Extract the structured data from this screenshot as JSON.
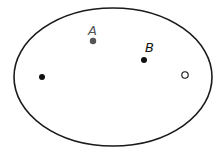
{
  "diagram": {
    "shape": "ellipse",
    "ellipse": {
      "cx": 113,
      "cy": 77,
      "rx": 99,
      "ry": 69,
      "stroke": "#1a1a1a"
    },
    "points": [
      {
        "id": "A",
        "label": "A",
        "x": 93,
        "y": 41,
        "fill": "#555555",
        "type": "filled",
        "label_x": 89,
        "label_y": 34,
        "label_color": "#555555"
      },
      {
        "id": "B",
        "label": "B",
        "x": 144,
        "y": 60,
        "fill": "#111111",
        "type": "filled",
        "label_x": 145,
        "label_y": 52,
        "label_color": "#111111"
      },
      {
        "id": "left",
        "label": "",
        "x": 42,
        "y": 77,
        "fill": "#111111",
        "type": "filled"
      },
      {
        "id": "right",
        "label": "",
        "x": 185,
        "y": 75,
        "fill": "#ffffff",
        "type": "open"
      }
    ]
  }
}
